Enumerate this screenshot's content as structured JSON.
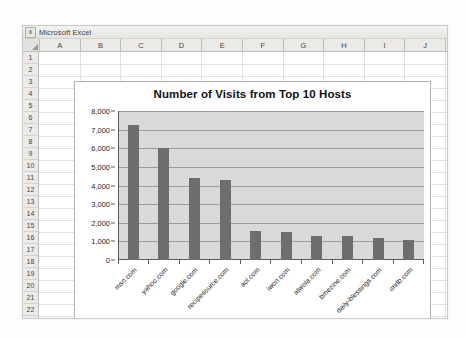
{
  "window": {
    "app_title": "Microsoft Excel",
    "logo_icon": "excel-x-icon",
    "logo_glyph": "X"
  },
  "grid": {
    "columns": [
      "A",
      "B",
      "C",
      "D",
      "E",
      "F",
      "G",
      "H",
      "I",
      "J"
    ],
    "rows": [
      "1",
      "2",
      "3",
      "4",
      "5",
      "6",
      "7",
      "8",
      "9",
      "10",
      "11",
      "12",
      "13",
      "14",
      "15",
      "16",
      "17",
      "18",
      "19",
      "20",
      "21",
      "22"
    ]
  },
  "chart_data": {
    "type": "bar",
    "title": "Number of Visits from Top 10 Hosts",
    "xlabel": "",
    "ylabel": "",
    "ylim": [
      0,
      8000
    ],
    "ytick_step": 1000,
    "ytick_labels": [
      "8,000",
      "7,000",
      "6,000",
      "5,000",
      "4,000",
      "3,000",
      "2,000",
      "1,000",
      "0"
    ],
    "grid": true,
    "legend": "none",
    "bar_color": "#6e6e6e",
    "plot_background": "#d9d9d9",
    "categories": [
      "msn.com",
      "yahoo.com",
      "google.com",
      "recipesource.com",
      "aol.com",
      "iwon.com",
      "atwola.com",
      "bmezine.com",
      "daily-blessings.com",
      "imdb.com"
    ],
    "values": [
      7250,
      6000,
      4400,
      4300,
      1550,
      1500,
      1300,
      1300,
      1200,
      1050
    ]
  }
}
